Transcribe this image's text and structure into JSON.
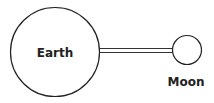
{
  "diagram": {
    "bodies": [
      {
        "name": "Earth",
        "label": "Earth"
      },
      {
        "name": "Moon",
        "label": "Moon"
      }
    ],
    "colors": {
      "stroke": "#222222",
      "background": "#ffffff"
    }
  }
}
